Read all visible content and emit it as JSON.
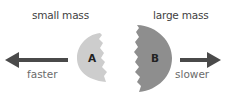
{
  "labels": {
    "small_mass": "small mass",
    "large_mass": "large mass",
    "faster": "faster",
    "slower": "slower",
    "a": "A",
    "b": "B"
  },
  "colors": {
    "small_fragment": "#cdcdcd",
    "large_fragment": "#8e8e8e",
    "arrow": "#4a4a4a"
  }
}
